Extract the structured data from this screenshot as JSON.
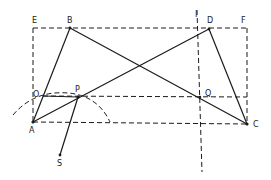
{
  "diagram": {
    "type": "geometric-construction",
    "labels": {
      "E": "E",
      "B": "B",
      "D": "D",
      "F": "F",
      "O": "O",
      "P": "P",
      "Q": "Q",
      "A": "A",
      "C": "C",
      "S": "S",
      "I": "I"
    },
    "points": {
      "E": [
        33,
        28
      ],
      "B": [
        70,
        28
      ],
      "D": [
        209,
        29
      ],
      "F": [
        247,
        28
      ],
      "O": [
        43,
        97
      ],
      "P": [
        78,
        97
      ],
      "Q": [
        200,
        97
      ],
      "A": [
        33,
        122
      ],
      "C": [
        247,
        124
      ],
      "S": [
        60,
        155
      ]
    },
    "solid_segments": [
      [
        "A",
        "B"
      ],
      [
        "B",
        "C"
      ],
      [
        "A",
        "D"
      ],
      [
        "D",
        "C"
      ],
      [
        "P",
        "S"
      ]
    ],
    "dashed_segments": [
      [
        "E",
        "F"
      ],
      [
        "E",
        "A"
      ],
      [
        "F",
        "C"
      ],
      [
        "A",
        "C"
      ],
      [
        "O",
        "Q"
      ],
      [
        "vertical-line-top",
        "vertical-line-bottom"
      ]
    ],
    "arc": "dashed arc centered near A passing through P",
    "colors": {
      "ink": "#1a1a1a",
      "background": "#ffffff"
    }
  }
}
